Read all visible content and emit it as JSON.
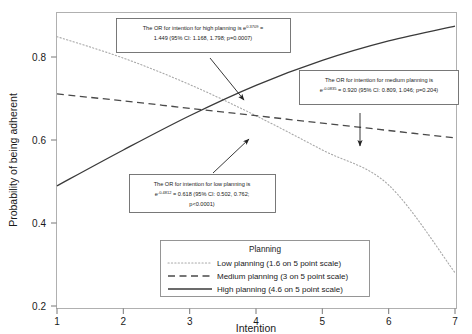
{
  "chart_data": {
    "type": "line",
    "title": "",
    "xlabel": "Intention",
    "ylabel": "Probability of being adherent",
    "xlim": [
      1,
      7
    ],
    "ylim": [
      0.17,
      0.93
    ],
    "xticks": [
      "1",
      "2",
      "3",
      "4",
      "5",
      "6",
      "7"
    ],
    "yticks": [
      "0.2",
      "0.4",
      "0.6",
      "0.8"
    ],
    "grid": false,
    "legend_position": "bottom-center",
    "legend_title": "Planning",
    "x": [
      1,
      2,
      3,
      4,
      5,
      6,
      7
    ],
    "series": [
      {
        "name": "Low planning (1.6 on 5 point scale)",
        "style": "dotted",
        "color": "#999999",
        "values": [
          0.868,
          0.813,
          0.745,
          0.665,
          0.577,
          0.487,
          0.262
        ]
      },
      {
        "name": "Medium planning (3 on 5 point scale)",
        "style": "dashed",
        "color": "#4a4a4a",
        "values": [
          0.721,
          0.703,
          0.684,
          0.665,
          0.646,
          0.627,
          0.608
        ]
      },
      {
        "name": "High planning (4.6 on 5 point scale)",
        "style": "solid",
        "color": "#3a3a3a",
        "values": [
          0.485,
          0.577,
          0.665,
          0.743,
          0.807,
          0.857,
          0.895
        ]
      }
    ],
    "annotations": [
      {
        "id": "high-planning",
        "line1_pre": "The OR for intention for high planning is e",
        "line1_sup": "0.3709",
        "line1_post": " =",
        "line2": "1.449 (95% CI: 1.168, 1.798; p=0.0007)"
      },
      {
        "id": "medium-planning",
        "line1": "The OR for intention for medium planning is",
        "line2_pre": "e",
        "line2_sup": "-0.0835",
        "line2_post": " = 0.920 (95% CI: 0.809, 1.046; p=0.204)"
      },
      {
        "id": "low-planning",
        "line1": "The OR for intention for low planning is",
        "line2_pre": "e",
        "line2_sup": "-0.4812",
        "line2_post": " = 0.618 (95% CI: 0.502, 0.762;",
        "line3": "p<0.0001)"
      }
    ]
  }
}
